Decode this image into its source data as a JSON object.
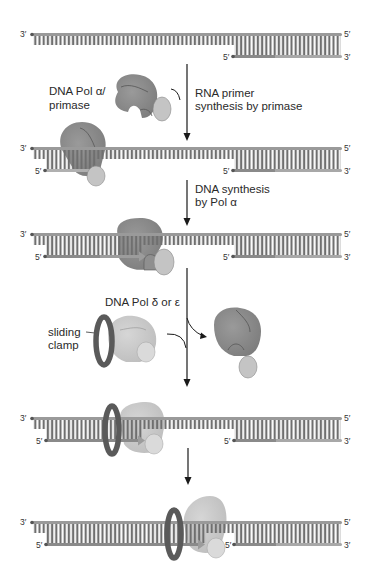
{
  "diagram": {
    "type": "DNA replication lagging-strand synthesis schematic",
    "colors": {
      "dna_backbone": "#9a9a9a",
      "dna_rungs": "#6f6f6f",
      "rna_primer": "#bdbdbd",
      "new_dna": "#8a8a8a",
      "pol_alpha_body": "#8f8f8f",
      "pol_alpha_primase": "#c4c4c4",
      "pol_delta_body": "#c9c9c9",
      "pol_delta_sub": "#dadada",
      "sliding_clamp": "#5a5a5a",
      "arrow": "#1a1a1a"
    },
    "strand_ends": {
      "top_left": "3′",
      "top_right": "5′",
      "bottom_left": "5′",
      "bottom_right": "3′"
    },
    "labels": {
      "pol_alpha_line1": "DNA Pol α/",
      "pol_alpha_line2": "primase",
      "step1_line1": "RNA primer",
      "step1_line2": "synthesis by primase",
      "step2_line1": "DNA synthesis",
      "step2_line2": "by Pol α",
      "pol_delta": "DNA Pol δ or ε",
      "clamp_line1": "sliding",
      "clamp_line2": "clamp"
    },
    "stages": [
      {
        "name": "template-with-downstream-fragment"
      },
      {
        "name": "primase-binds-and-makes-rna-primer"
      },
      {
        "name": "pol-alpha-extends-primer"
      },
      {
        "name": "pol-delta-epsilon-with-clamp-loads"
      },
      {
        "name": "pol-delta-epsilon-completes-fragment"
      }
    ]
  }
}
